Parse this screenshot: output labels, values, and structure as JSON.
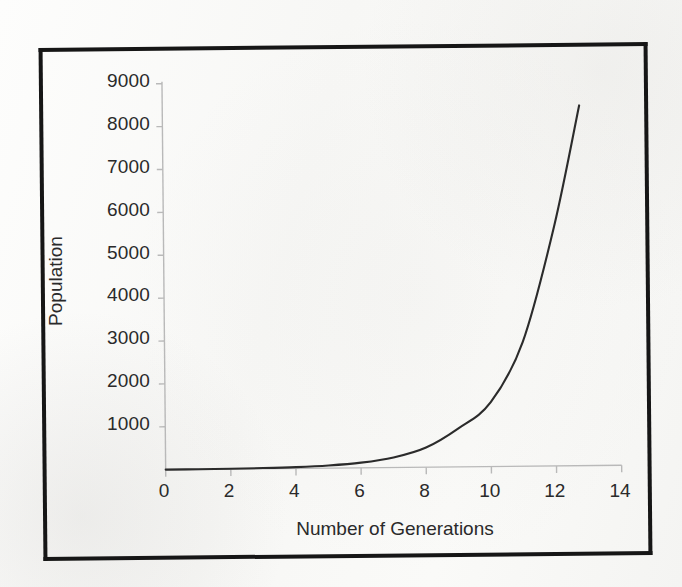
{
  "figure": {
    "background_color": "#fbfbfa",
    "border_color": "#161616",
    "axis_color": "#b9b9b9",
    "curve_color": "#2b2b2b",
    "text_color": "#2a2a2a"
  },
  "chart_data": {
    "type": "line",
    "title": "",
    "xlabel": "Number of Generations",
    "ylabel": "Population",
    "xlim": [
      0,
      14
    ],
    "ylim": [
      0,
      9000
    ],
    "grid": false,
    "legend": null,
    "x_ticks": [
      "0",
      "2",
      "4",
      "6",
      "8",
      "10",
      "12",
      "14"
    ],
    "x_tick_values": [
      0,
      2,
      4,
      6,
      8,
      10,
      12,
      14
    ],
    "y_ticks": [
      "1000",
      "2000",
      "3000",
      "4000",
      "5000",
      "6000",
      "7000",
      "8000",
      "9000"
    ],
    "y_tick_values": [
      1000,
      2000,
      3000,
      4000,
      5000,
      6000,
      7000,
      8000,
      9000
    ],
    "series": [
      {
        "name": "Population",
        "x": [
          0,
          1,
          2,
          3,
          4,
          5,
          6,
          7,
          8,
          9,
          10,
          11,
          12,
          12.8
        ],
        "values": [
          2,
          4,
          8,
          16,
          31,
          61,
          120,
          235,
          460,
          900,
          1500,
          2900,
          5600,
          8400
        ]
      }
    ]
  }
}
